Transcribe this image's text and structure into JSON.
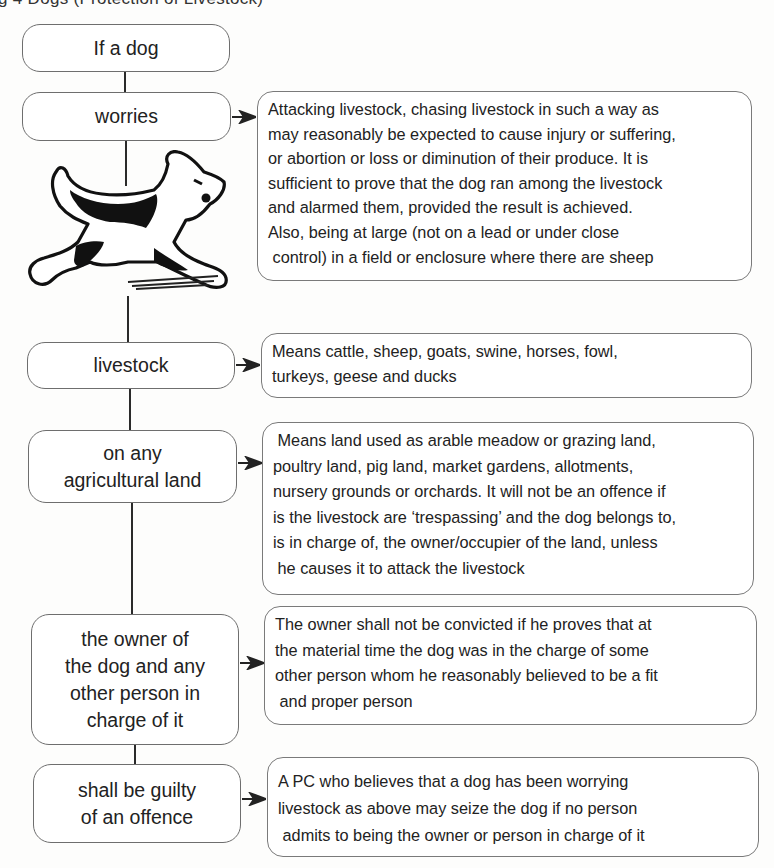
{
  "header": {
    "cropped_title": "g 4 Dogs (Protection of Livestock)"
  },
  "flow": [
    {
      "id": "if-a-dog",
      "label": "If a dog"
    },
    {
      "id": "worries",
      "label": "worries",
      "description": [
        "Attacking livestock, chasing livestock in such a way as",
        "may reasonably be expected to cause injury or suffering,",
        "or abortion or loss or diminution of their produce. It is",
        "sufficient to prove that the dog ran among the livestock",
        "and alarmed them, provided the result is achieved.",
        "Also, being at large (not on a lead or under close",
        " control) in a field or enclosure where there are sheep"
      ]
    },
    {
      "id": "livestock",
      "label": "livestock",
      "description": [
        "Means cattle, sheep, goats, swine, horses, fowl,",
        "turkeys, geese and ducks"
      ]
    },
    {
      "id": "agricultural-land",
      "label_lines": [
        "on any",
        "agricultural land"
      ],
      "description": [
        " Means land used as arable meadow or grazing land,",
        "poultry land, pig land, market gardens, allotments,",
        "nursery grounds or orchards. It will not be an offence if",
        "is the livestock are ‘trespassing’ and the dog belongs to,",
        "is in charge of, the owner/occupier of the land, unless",
        " he causes it to attack the livestock"
      ]
    },
    {
      "id": "owner",
      "label_lines": [
        "the owner of",
        "the dog and any",
        "other person in",
        "charge of it"
      ],
      "description": [
        "The owner shall not be convicted if he proves that at",
        "the material time the dog was in the charge of some",
        "other person whom he reasonably believed to be a fit",
        " and proper person"
      ]
    },
    {
      "id": "guilty",
      "label_lines": [
        "shall be guilty",
        "of an offence"
      ],
      "description": [
        "A PC who believes that a dog has been worrying",
        "livestock as above may seize the dog if no person",
        " admits to being the owner or person in charge of it"
      ]
    }
  ],
  "illustration": {
    "icon": "running-terrier-dog-icon"
  }
}
